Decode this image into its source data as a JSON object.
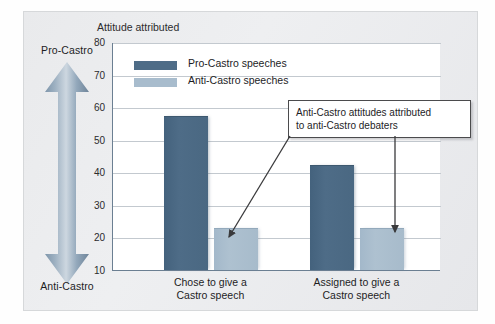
{
  "figure": {
    "axis_arrow": {
      "top_label": "Pro-Castro",
      "bottom_label": "Anti-Castro",
      "icon": "double-headed-vertical-arrow"
    },
    "annotation": {
      "line1": "Anti-Castro attitudes attributed",
      "line2": "to anti-Castro debaters"
    },
    "colors": {
      "series_pro": "#4e6c87",
      "series_anti": "#a8bccd",
      "panel_background": "#e9eaec",
      "plot_background": "#ffffff",
      "axis": "#6b7f92",
      "gridline": "#c3c9cf",
      "callout_border": "#4b4b4d",
      "text": "#1d1d1f"
    }
  },
  "chart_data": {
    "type": "bar",
    "title": "Attitude attributed",
    "xlabel": "",
    "ylabel": "",
    "categories": [
      "Chose to give a Castro speech",
      "Assigned to give a Castro speech"
    ],
    "category_lines": [
      [
        "Chose to give a",
        "Castro speech"
      ],
      [
        "Assigned to give a",
        "Castro speech"
      ]
    ],
    "series": [
      {
        "name": "Pro-Castro speeches",
        "color": "#4e6c87",
        "values": [
          57,
          42
        ]
      },
      {
        "name": "Anti-Castro speeches",
        "color": "#a8bccd",
        "values": [
          22.5,
          22.5
        ]
      }
    ],
    "legend": [
      "Pro-Castro speeches",
      "Anti-Castro speeches"
    ],
    "legend_position": "inside-top-left",
    "ylim": [
      10,
      80
    ],
    "yticks": [
      10,
      20,
      30,
      40,
      50,
      60,
      70,
      80
    ],
    "ytick_labels": [
      "10",
      "20",
      "30",
      "40",
      "50",
      "60",
      "70",
      "80"
    ],
    "grid": true,
    "annotations": [
      {
        "text": "Anti-Castro attitudes attributed to anti-Castro debaters",
        "points_to": [
          "Anti-Castro speeches / Chose to give a Castro speech",
          "Anti-Castro speeches / Assigned to give a Castro speech"
        ]
      }
    ]
  }
}
